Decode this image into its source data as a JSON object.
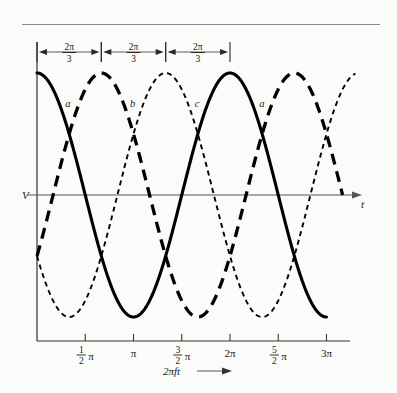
{
  "figure": {
    "kind": "three-phase-voltage-waveforms",
    "background_color": "#fbfbf9",
    "ink_color": "#000000",
    "axis_color": "#555555"
  },
  "axes": {
    "y_axis_label": "V",
    "t_axis_label": "t",
    "x_axis_caption_expr": "2πft",
    "x_axis_caption_arrow": "⟶",
    "x_ticks": [
      {
        "label_whole": "",
        "label_num": "1",
        "label_den": "2",
        "label_sym": "π",
        "value_over_pi": 0.5
      },
      {
        "label_whole": "π",
        "label_num": "",
        "label_den": "",
        "label_sym": "",
        "value_over_pi": 1.0
      },
      {
        "label_whole": "",
        "label_num": "3",
        "label_den": "2",
        "label_sym": "π",
        "value_over_pi": 1.5
      },
      {
        "label_whole": "2π",
        "label_num": "",
        "label_den": "",
        "label_sym": "",
        "value_over_pi": 2.0
      },
      {
        "label_whole": "",
        "label_num": "5",
        "label_den": "2",
        "label_sym": "π",
        "value_over_pi": 2.5
      },
      {
        "label_whole": "3π",
        "label_num": "",
        "label_den": "",
        "label_sym": "",
        "value_over_pi": 3.0
      }
    ]
  },
  "phase_markers": {
    "count": 3,
    "label_numerator": "2π",
    "label_denominator": "3",
    "description": "double-headed arrow spans of 2π/3 between successive phase peaks"
  },
  "curve_labels": [
    {
      "text": "a",
      "for_series": "a"
    },
    {
      "text": "b",
      "for_series": "b"
    },
    {
      "text": "c",
      "for_series": "c"
    },
    {
      "text": "a",
      "for_series": "a"
    }
  ],
  "chart_data": {
    "type": "line",
    "title": "",
    "subtitle": "",
    "xlabel": "2πft",
    "ylabel": "V",
    "xlim": [
      0,
      3.35
    ],
    "ylim": [
      -1.12,
      1.12
    ],
    "x_unit": "pi-radians",
    "grid": false,
    "legend": "inline-curve-labels",
    "x_tick_values_over_pi": [
      0.5,
      1.0,
      1.5,
      2.0,
      2.5,
      3.0
    ],
    "x_tick_labels": [
      "1/2 π",
      "π",
      "3/2 π",
      "2π",
      "5/2 π",
      "3π"
    ],
    "y_tick_values": [
      0
    ],
    "y_tick_labels": [
      "V"
    ],
    "amplitude": 1.0,
    "phase_offset_over_pi": 0.6667,
    "series": [
      {
        "name": "a",
        "style": "solid",
        "formula": "cos(2*pi*f*t)",
        "phase_deg": 0,
        "x_start_over_pi": 0.0,
        "x_end_over_pi": 3.0,
        "peaks_over_pi": [
          0.0,
          2.0
        ],
        "troughs_over_pi": [
          1.0,
          3.0
        ],
        "zero_crossings_over_pi": [
          0.5,
          1.5,
          2.5
        ],
        "y_at_x0": 1.0
      },
      {
        "name": "b",
        "style": "thick-dashed",
        "formula": "cos(2*pi*f*t - 2*pi/3)",
        "phase_deg": -120,
        "x_start_over_pi": 0.0,
        "x_end_over_pi": 3.1667,
        "peaks_over_pi": [
          0.6667,
          2.6667
        ],
        "troughs_over_pi": [
          1.6667
        ],
        "zero_crossings_over_pi": [
          0.1667,
          1.1667,
          2.1667,
          3.1667
        ],
        "y_at_x0": -0.5
      },
      {
        "name": "c",
        "style": "fine-dotted",
        "formula": "cos(2*pi*f*t + 2*pi/3)",
        "phase_deg": 120,
        "x_start_over_pi": 0.0,
        "x_end_over_pi": 3.3,
        "peaks_over_pi": [
          1.3333,
          3.3333
        ],
        "troughs_over_pi": [
          0.3333,
          2.3333
        ],
        "zero_crossings_over_pi": [
          0.8333,
          1.8333,
          2.8333
        ],
        "y_at_x0": -0.5
      }
    ]
  }
}
